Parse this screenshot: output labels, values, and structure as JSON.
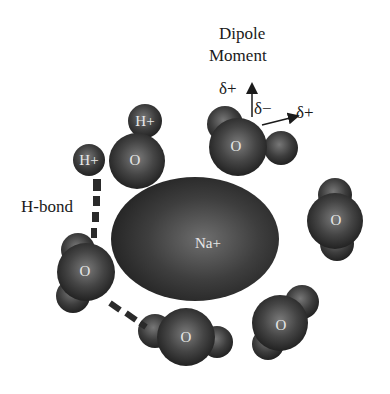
{
  "diagram": {
    "center_ion": {
      "label": "Na+",
      "shape": "ellipse",
      "cx": 195,
      "cy": 239,
      "rx": 84,
      "ry": 61
    },
    "annotations": {
      "dipole_title_line1": "Dipole",
      "dipole_title_line2": "Moment",
      "delta_plus_up": "δ+",
      "delta_minus": "δ−",
      "delta_plus_right": "δ+",
      "hbond_label": "H-bond"
    },
    "water_molecules": [
      {
        "id": "w1",
        "oxygen_label": "O",
        "hydrogen_labels": [
          "H+",
          "H+"
        ],
        "position": "upper-left"
      },
      {
        "id": "w2",
        "oxygen_label": "O",
        "position": "top"
      },
      {
        "id": "w3",
        "oxygen_label": "O",
        "position": "right"
      },
      {
        "id": "w4",
        "oxygen_label": "O",
        "position": "lower-right"
      },
      {
        "id": "w5",
        "oxygen_label": "O",
        "position": "bottom"
      },
      {
        "id": "w6",
        "oxygen_label": "O",
        "position": "left"
      }
    ],
    "colors": {
      "sphere_dark": "#2a2a2a",
      "sphere_mid": "#555555",
      "sphere_highlight": "#8a8a8a",
      "text": "#1a1a1a",
      "atom_text": "#e8e8e8",
      "background": "#ffffff"
    }
  }
}
